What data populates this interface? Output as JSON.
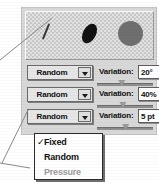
{
  "panel": {
    "background_color": "#d8d8d8",
    "preview": {
      "name": "brush-preview",
      "shapes": [
        {
          "name": "thin-stroke-sample",
          "color": "#3a3a3a"
        },
        {
          "name": "small-ellipse-sample",
          "color": "#111111"
        },
        {
          "name": "large-circle-sample",
          "color": "#6f6f6f"
        }
      ]
    },
    "rows": [
      {
        "dropdown_label": "Random",
        "dropdown_arrow": "chevron-down-icon",
        "variation_label": "Variation:",
        "variation_value": "20°",
        "slider_percent": 38
      },
      {
        "dropdown_label": "Random",
        "dropdown_arrow": "chevron-down-icon",
        "variation_label": "Variation:",
        "variation_value": "40%",
        "slider_percent": 40
      },
      {
        "dropdown_label": "Random",
        "dropdown_arrow": "chevron-down-icon",
        "variation_label": "Variation:",
        "variation_value": "5 pt",
        "slider_percent": 45
      }
    ]
  },
  "popup_menu": {
    "items": [
      {
        "label": "Fixed",
        "checked": true,
        "check_glyph": "✓",
        "disabled": false
      },
      {
        "label": "Random",
        "checked": false,
        "check_glyph": "",
        "disabled": false
      },
      {
        "label": "Pressure",
        "checked": false,
        "check_glyph": "",
        "disabled": true
      }
    ]
  },
  "colors": {
    "panel_bg": "#d8d8d8",
    "field_bg": "#ffffff",
    "text": "#111111",
    "disabled_text": "#9b9b9b",
    "border": "#6b6b6b"
  }
}
